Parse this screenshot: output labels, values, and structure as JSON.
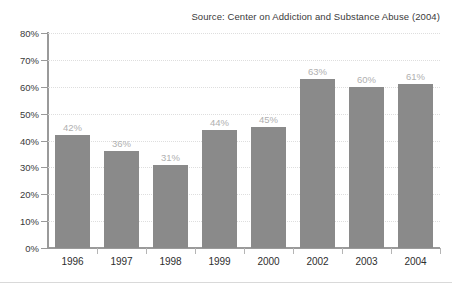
{
  "source_note": "Source: Center on Addiction and Substance Abuse (2004)",
  "chart_data": {
    "type": "bar",
    "title": "",
    "subtitle": "",
    "xlabel": "",
    "ylabel": "",
    "categories": [
      "1996",
      "1997",
      "1998",
      "1999",
      "2000",
      "2002",
      "2003",
      "2004"
    ],
    "values": [
      42,
      36,
      31,
      44,
      45,
      63,
      60,
      61
    ],
    "value_labels": [
      "42%",
      "36%",
      "31%",
      "44%",
      "45%",
      "63%",
      "60%",
      "61%"
    ],
    "ylim": [
      0,
      80
    ],
    "ytick_values": [
      0,
      10,
      20,
      30,
      40,
      50,
      60,
      70,
      80
    ],
    "ytick_labels": [
      "0%",
      "10%",
      "20%",
      "30%",
      "40%",
      "50%",
      "60%",
      "70%",
      "80%"
    ],
    "grid": true,
    "grid_axis": "y",
    "legend": false,
    "legend_position": "none",
    "annotations": [
      "Source: Center on Addiction and Substance Abuse (2004)"
    ],
    "note": "Year 2001 is absent from the category axis.",
    "bar_color": "#8a8a8a",
    "value_label_color": "#b0b0b0",
    "axis_color": "#9a9a9a",
    "grid_color": "#dedede",
    "text_color": "#2e2e2e",
    "background_color": "#ffffff"
  }
}
